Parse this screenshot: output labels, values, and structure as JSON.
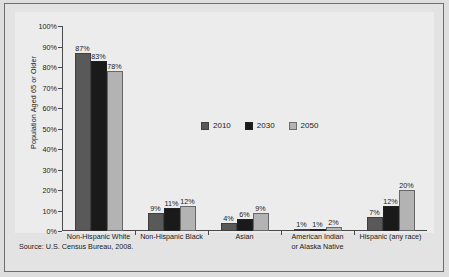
{
  "chart_data": {
    "type": "bar",
    "title": "",
    "xlabel": "",
    "ylabel": "Population Aged 65 or Older",
    "ylim": [
      0,
      100
    ],
    "ytick_labels": [
      "0%",
      "10%",
      "20%",
      "30%",
      "40%",
      "50%",
      "60%",
      "70%",
      "80%",
      "90%",
      "100%"
    ],
    "ytick_values": [
      0,
      10,
      20,
      30,
      40,
      50,
      60,
      70,
      80,
      90,
      100
    ],
    "grid": false,
    "legend_position": "center",
    "categories": [
      "Non-Hispanic White",
      "Non-Hispanic Black",
      "Asian",
      "American Indian or Alaska Native",
      "Hispanic (any race)"
    ],
    "category_lines": [
      [
        "Non-Hispanic White"
      ],
      [
        "Non-Hispanic Black"
      ],
      [
        "Asian"
      ],
      [
        "American Indian",
        "or Alaska Native"
      ],
      [
        "Hispanic (any race)"
      ]
    ],
    "series": [
      {
        "name": "2010",
        "color": "#595959",
        "values": [
          87,
          9,
          4,
          1,
          7
        ],
        "labels": [
          "87%",
          "9%",
          "4%",
          "1%",
          "7%"
        ]
      },
      {
        "name": "2030",
        "color": "#1a1a1a",
        "values": [
          83,
          11,
          6,
          1,
          12
        ],
        "labels": [
          "83%",
          "11%",
          "6%",
          "1%",
          "12%"
        ]
      },
      {
        "name": "2050",
        "color": "#b3b3b3",
        "values": [
          78,
          12,
          9,
          2,
          20
        ],
        "labels": [
          "78%",
          "12%",
          "9%",
          "2%",
          "20%"
        ]
      }
    ],
    "source_note": "Source: U.S. Census Bureau, 2008."
  },
  "colors": {
    "page_background": "#dedede",
    "panel_background": "#e3e3e3",
    "plot_background": "#ececec",
    "axis": "#4a4a4a",
    "text": "#1a1a1a",
    "series_2010": "#595959",
    "series_2030": "#1a1a1a",
    "series_2050": "#b3b3b3"
  }
}
